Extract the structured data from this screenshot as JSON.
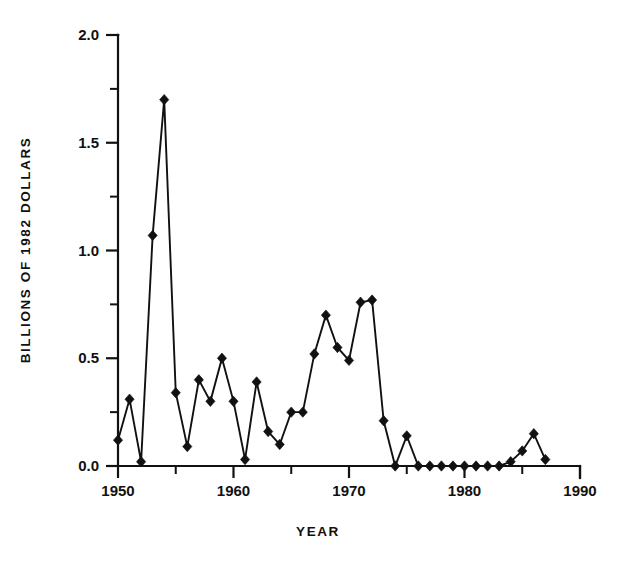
{
  "chart_data": {
    "type": "line",
    "title": "",
    "xlabel": "YEAR",
    "ylabel": "BILLIONS OF 1982 DOLLARS",
    "xlim": [
      1950,
      1990
    ],
    "ylim": [
      0.0,
      2.0
    ],
    "grid": false,
    "legend": null,
    "marker": "filled-diamond",
    "x_major_ticks": [
      1950,
      1960,
      1970,
      1980,
      1990
    ],
    "x_major_tick_labels": [
      "1950",
      "1960",
      "1970",
      "1980",
      "1990"
    ],
    "x_minor_ticks": [
      1955,
      1965,
      1975,
      1985
    ],
    "y_major_ticks": [
      0.0,
      0.5,
      1.0,
      1.5,
      2.0
    ],
    "y_major_tick_labels": [
      "0.0",
      "0.5",
      "1.0",
      "1.5",
      "2.0"
    ],
    "y_minor_ticks": [
      0.25,
      0.75,
      1.25,
      1.75
    ],
    "x": [
      1950,
      1951,
      1952,
      1953,
      1954,
      1955,
      1956,
      1957,
      1958,
      1959,
      1960,
      1961,
      1962,
      1963,
      1964,
      1965,
      1966,
      1967,
      1968,
      1969,
      1970,
      1971,
      1972,
      1973,
      1974,
      1975,
      1976,
      1977,
      1978,
      1979,
      1980,
      1981,
      1982,
      1983,
      1984,
      1985,
      1986,
      1987
    ],
    "values": [
      0.12,
      0.31,
      0.02,
      1.07,
      1.7,
      0.34,
      0.09,
      0.4,
      0.3,
      0.5,
      0.3,
      0.03,
      0.39,
      0.16,
      0.1,
      0.25,
      0.25,
      0.52,
      0.7,
      0.55,
      0.49,
      0.76,
      0.77,
      0.21,
      0.0,
      0.14,
      0.0,
      0.0,
      0.0,
      0.0,
      0.0,
      0.0,
      0.0,
      0.0,
      0.02,
      0.07,
      0.15,
      0.03
    ]
  },
  "axes": {
    "y_axis_title": "BILLIONS OF 1982 DOLLARS",
    "x_axis_title": "YEAR"
  },
  "style": {
    "ink_color": "#111111",
    "background_color": "#ffffff"
  }
}
